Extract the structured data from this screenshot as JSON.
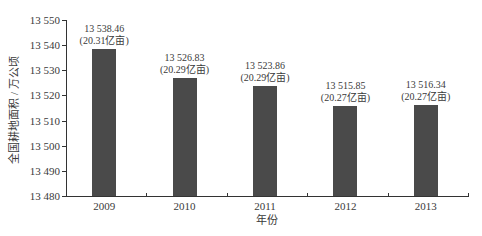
{
  "chart_data": {
    "type": "bar",
    "title": "",
    "xlabel": "年份",
    "ylabel": "全国耕地面积 / 万公顷",
    "categories": [
      "2009",
      "2010",
      "2011",
      "2012",
      "2013"
    ],
    "values": [
      13538.46,
      13526.83,
      13523.86,
      13515.85,
      13516.34
    ],
    "data_labels": [
      {
        "value": "13 538.46",
        "sub": "(20.31亿亩)"
      },
      {
        "value": "13 526.83",
        "sub": "(20.29亿亩)"
      },
      {
        "value": "13 523.86",
        "sub": "(20.29亿亩)"
      },
      {
        "value": "13 515.85",
        "sub": "(20.27亿亩)"
      },
      {
        "value": "13 516.34",
        "sub": "(20.27亿亩)"
      }
    ],
    "ylim": [
      13480,
      13550
    ],
    "yticks": [
      "13 480",
      "13 490",
      "13 500",
      "13 510",
      "13 520",
      "13 530",
      "13 540",
      "13 550"
    ],
    "grid": false,
    "legend": null,
    "bar_color": "#4a4a4a"
  }
}
